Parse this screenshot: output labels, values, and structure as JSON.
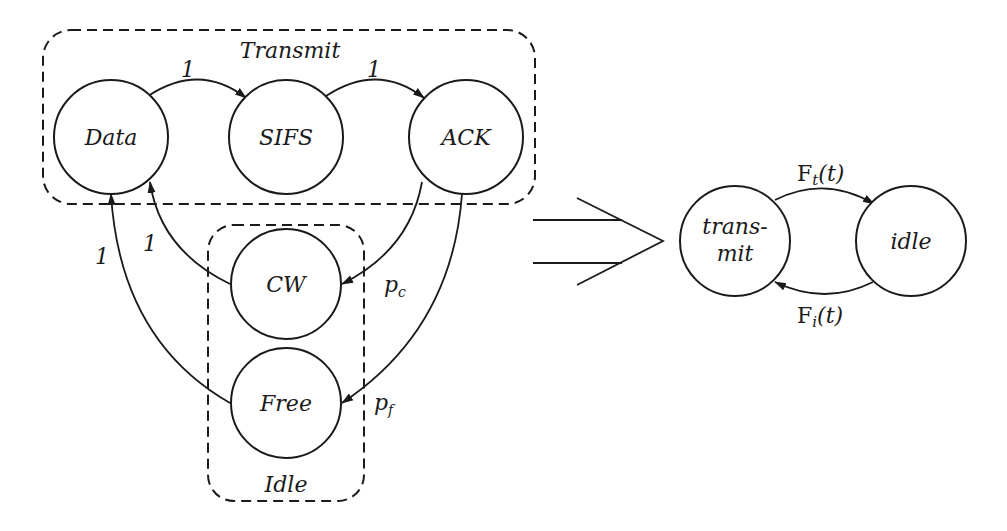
{
  "diagram": {
    "left": {
      "groups": [
        {
          "id": "transmit",
          "label": "Transmit"
        },
        {
          "id": "idle",
          "label": "Idle"
        }
      ],
      "nodes": [
        {
          "id": "data",
          "label": "Data",
          "group": "transmit"
        },
        {
          "id": "sifs",
          "label": "SIFS",
          "group": "transmit"
        },
        {
          "id": "ack",
          "label": "ACK",
          "group": "transmit"
        },
        {
          "id": "cw",
          "label": "CW",
          "group": "idle"
        },
        {
          "id": "free",
          "label": "Free",
          "group": "idle"
        }
      ],
      "edges": [
        {
          "from": "data",
          "to": "sifs",
          "label": "1"
        },
        {
          "from": "sifs",
          "to": "ack",
          "label": "1"
        },
        {
          "from": "ack",
          "to": "cw",
          "label": "p",
          "sub": "c"
        },
        {
          "from": "ack",
          "to": "free",
          "label": "p",
          "sub": "f"
        },
        {
          "from": "cw",
          "to": "data",
          "label": "1"
        },
        {
          "from": "free",
          "to": "data",
          "label": "1"
        }
      ]
    },
    "transform_arrow": "implies",
    "right": {
      "nodes": [
        {
          "id": "transmit",
          "label_line1": "trans-",
          "label_line2": "mit"
        },
        {
          "id": "idle",
          "label": "idle"
        }
      ],
      "edges": [
        {
          "from": "transmit",
          "to": "idle",
          "label": "F",
          "sub": "t",
          "suffix": "(t)"
        },
        {
          "from": "idle",
          "to": "transmit",
          "label": "F",
          "sub": "i",
          "suffix": "(t)"
        }
      ]
    }
  }
}
